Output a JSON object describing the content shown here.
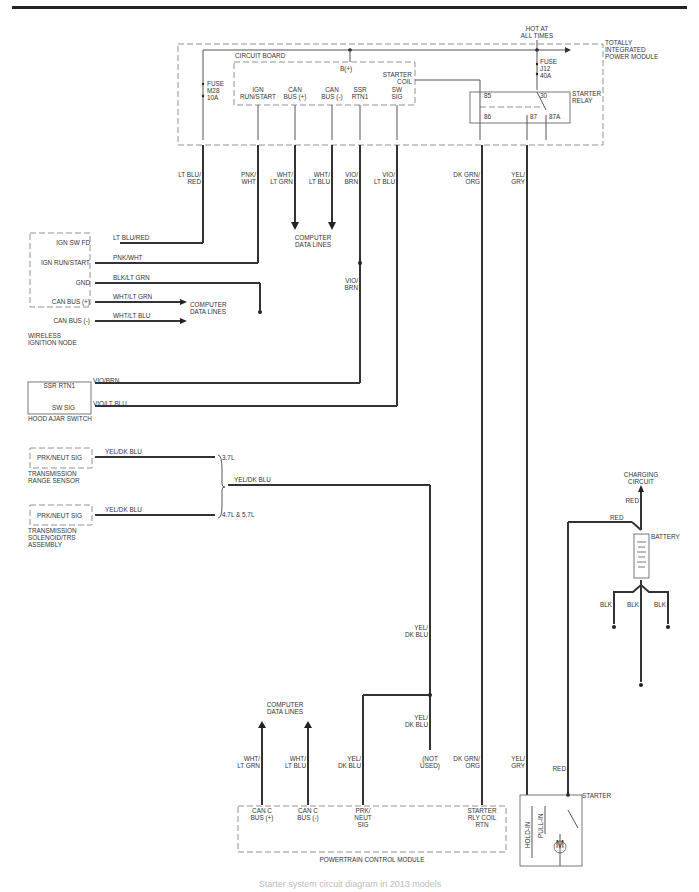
{
  "diagram": {
    "caption": "Starter system circuit diagram in 2013 models",
    "hot_at_all_times": [
      "HOT AT",
      "ALL TIMES"
    ],
    "tipm": {
      "title": [
        "TOTALLY",
        "INTEGRATED",
        "POWER MODULE"
      ],
      "circuit_board": "CIRCUIT BOARD",
      "b_plus": "B(+)",
      "fuse_m28": [
        "FUSE",
        "M28",
        "10A"
      ],
      "fuse_j12": [
        "FUSE",
        "J12",
        "40A"
      ],
      "starter_coil": [
        "STARTER",
        "COIL"
      ],
      "starter_relay": [
        "STARTER",
        "RELAY"
      ],
      "relay_pins": [
        "85",
        "86",
        "30",
        "87",
        "87A"
      ],
      "pins": [
        [
          "IGN",
          "RUN/START"
        ],
        [
          "CAN",
          "BUS (+)"
        ],
        [
          "CAN",
          "BUS (-)"
        ],
        [
          "SSR",
          "RTN1"
        ],
        [
          "SW",
          "SIG"
        ]
      ]
    },
    "wires_vertical": {
      "lt_blu_red": [
        "LT BLU/",
        "RED"
      ],
      "pnk_wht": [
        "PNK/",
        "WHT"
      ],
      "wht_lt_grn": [
        "WHT/",
        "LT GRN"
      ],
      "wht_lt_blu": [
        "WHT/",
        "LT BLU"
      ],
      "vio_brn": [
        "VIO/",
        "BRN"
      ],
      "vio_lt_blu": [
        "VIO/",
        "LT BLU"
      ],
      "dk_grn_org": [
        "DK GRN/",
        "ORG"
      ],
      "yel_gry": [
        "YEL/",
        "GRY"
      ],
      "vio_brn_2": [
        "VIO/",
        "BRN"
      ]
    },
    "computer_data_lines": [
      "COMPUTER",
      "DATA LINES"
    ],
    "wireless_ignition_node": {
      "title": [
        "WIRELESS",
        "IGNITION NODE"
      ],
      "pins": [
        "IGN SW FD",
        "IGN RUN/START",
        "GND",
        "CAN BUS (+)",
        "CAN BUS (-)"
      ],
      "wires": [
        "LT BLU/RED",
        "PNK/WHT",
        "BLK/LT GRN",
        "WHT/LT GRN",
        "WHT/LT BLU"
      ]
    },
    "hood_ajar_switch": {
      "title": "HOOD AJAR SWITCH",
      "pins": [
        "SSR RTN1",
        "SW SIG"
      ],
      "wires": [
        "VIO/BRN",
        "VIO/LT BLU"
      ]
    },
    "transmission_range_sensor": {
      "title": [
        "TRANSMISSION",
        "RANGE SENSOR"
      ],
      "pin": "PRK/NEUT SIG",
      "wire": "YEL/DK BLU",
      "engine": "3.7L"
    },
    "transmission_solenoid": {
      "title": [
        "TRANSMISSION",
        "SOLENOID/TRS",
        "ASSEMBLY"
      ],
      "pin": "PRK/NEUT SIG",
      "wire": "YEL/DK BLU",
      "engine": "4.7L & 5.7L"
    },
    "merged_wire": "YEL/DK BLU",
    "yel_dk_blu_v": [
      "YEL/",
      "DK BLU"
    ],
    "not_used": [
      "(NOT",
      "USED)"
    ],
    "battery": {
      "charging_circuit": [
        "CHARGING",
        "CIRCUIT"
      ],
      "label": "BATTERY",
      "red": "RED",
      "blk": "BLK"
    },
    "pcm": {
      "title": "POWERTRAIN CONTROL MODULE",
      "pins": [
        [
          "CAN C",
          "BUS (+)"
        ],
        [
          "CAN C",
          "BUS (-)"
        ],
        [
          "PRK/",
          "NEUT",
          "SIG"
        ],
        [
          "STARTER",
          "RLY COIL",
          "RTN"
        ]
      ]
    },
    "starter": {
      "label": "STARTER",
      "hold_in": "HOLD-IN",
      "pull_in": "PULL-IN",
      "motor": "M"
    }
  }
}
